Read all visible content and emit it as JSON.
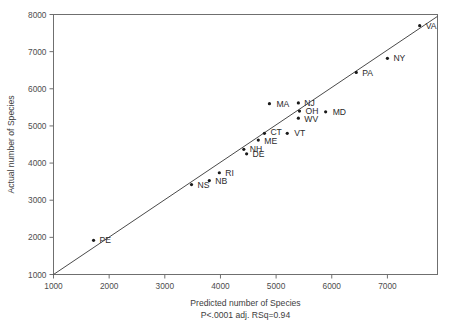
{
  "chart_data": {
    "type": "scatter",
    "title": "",
    "xlabel": "Predicted number of Species",
    "ylabel": "Actual number of Species",
    "caption": "P<.0001 adj. RSq=0.94",
    "xlim": [
      1000,
      7900
    ],
    "ylim": [
      1000,
      8000
    ],
    "xticks": [
      1000,
      2000,
      3000,
      4000,
      5000,
      6000,
      7000
    ],
    "xticklabels": [
      "1000",
      "2000",
      "3000",
      "4000",
      "5000",
      "6000",
      "7000"
    ],
    "yticks": [
      1000,
      2000,
      3000,
      4000,
      5000,
      6000,
      7000,
      8000
    ],
    "yticklabels": [
      "1000",
      "2000",
      "3000",
      "4000",
      "5000",
      "6000",
      "7000",
      "8000"
    ],
    "grid": false,
    "legend": null,
    "fit_line": {
      "label": "identity/regression line",
      "x": [
        1000,
        7900
      ],
      "y": [
        1000,
        7950
      ]
    },
    "points": [
      {
        "label": "PE",
        "x": 1720,
        "y": 1920,
        "label_dx": 6,
        "label_dy": 3
      },
      {
        "label": "NS",
        "x": 3480,
        "y": 3420,
        "label_dx": 6,
        "label_dy": 3
      },
      {
        "label": "NB",
        "x": 3800,
        "y": 3530,
        "label_dx": 6,
        "label_dy": 3
      },
      {
        "label": "RI",
        "x": 3980,
        "y": 3740,
        "label_dx": 6,
        "label_dy": 3
      },
      {
        "label": "NH",
        "x": 4420,
        "y": 4370,
        "label_dx": 6,
        "label_dy": 3
      },
      {
        "label": "DE",
        "x": 4470,
        "y": 4250,
        "label_dx": 6,
        "label_dy": 3
      },
      {
        "label": "ME",
        "x": 4680,
        "y": 4620,
        "label_dx": 6,
        "label_dy": 4
      },
      {
        "label": "CT",
        "x": 4790,
        "y": 4800,
        "label_dx": 6,
        "label_dy": 2
      },
      {
        "label": "VT",
        "x": 5200,
        "y": 4800,
        "label_dx": 7,
        "label_dy": 3
      },
      {
        "label": "MA",
        "x": 4880,
        "y": 5600,
        "label_dx": 7,
        "label_dy": 3
      },
      {
        "label": "NJ",
        "x": 5400,
        "y": 5620,
        "label_dx": 6,
        "label_dy": 3
      },
      {
        "label": "OH",
        "x": 5420,
        "y": 5400,
        "label_dx": 6,
        "label_dy": 3
      },
      {
        "label": "WV",
        "x": 5400,
        "y": 5210,
        "label_dx": 6,
        "label_dy": 4
      },
      {
        "label": "MD",
        "x": 5890,
        "y": 5380,
        "label_dx": 7,
        "label_dy": 3
      },
      {
        "label": "PA",
        "x": 6440,
        "y": 6440,
        "label_dx": 6,
        "label_dy": 4
      },
      {
        "label": "NY",
        "x": 7000,
        "y": 6820,
        "label_dx": 6,
        "label_dy": 3
      },
      {
        "label": "VA",
        "x": 7580,
        "y": 7700,
        "label_dx": 6,
        "label_dy": 3
      }
    ]
  }
}
